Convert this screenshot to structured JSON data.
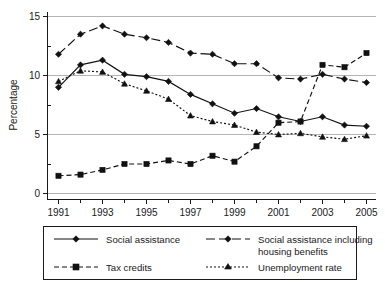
{
  "chart_data": {
    "type": "line",
    "title": "",
    "xlabel": "",
    "ylabel": "Percentage",
    "xlim": [
      1991,
      2005
    ],
    "ylim": [
      0,
      15
    ],
    "yticks": [
      0,
      5,
      10,
      15
    ],
    "ytick_labels": [
      "0",
      "5",
      "10",
      "15"
    ],
    "x": [
      1991,
      1992,
      1993,
      1994,
      1995,
      1996,
      1997,
      1998,
      1999,
      2000,
      2001,
      2002,
      2003,
      2004,
      2005
    ],
    "xtick_labels": [
      "1991",
      "",
      "1993",
      "",
      "1995",
      "",
      "1997",
      "",
      "1999",
      "",
      "2001",
      "",
      "2003",
      "",
      "2005"
    ],
    "grid": true,
    "legend_position": "below",
    "series": [
      {
        "name": "Social assistance",
        "line_style": "solid",
        "marker": "diamond",
        "color": "#111111",
        "values": [
          9.0,
          10.9,
          11.3,
          10.1,
          9.9,
          9.5,
          8.4,
          7.6,
          6.8,
          7.2,
          6.5,
          6.1,
          6.5,
          5.8,
          5.7
        ]
      },
      {
        "name": "Social assistance including housing benefits",
        "line_style": "long-dash",
        "marker": "diamond",
        "color": "#111111",
        "values": [
          11.8,
          13.5,
          14.2,
          13.5,
          13.2,
          12.8,
          11.9,
          11.8,
          11.0,
          11.0,
          9.8,
          9.7,
          10.1,
          9.7,
          9.4
        ]
      },
      {
        "name": "Tax credits",
        "line_style": "dashed",
        "marker": "square",
        "color": "#111111",
        "values": [
          1.5,
          1.6,
          2.0,
          2.5,
          2.5,
          2.8,
          2.5,
          3.2,
          2.7,
          4.0,
          6.0,
          6.1,
          10.9,
          10.7,
          11.9
        ]
      },
      {
        "name": "Unemployment rate",
        "line_style": "dotted",
        "marker": "triangle",
        "color": "#111111",
        "values": [
          9.5,
          10.4,
          10.3,
          9.3,
          8.7,
          8.0,
          6.6,
          6.1,
          5.8,
          5.2,
          5.0,
          5.1,
          4.8,
          4.6,
          4.9
        ]
      }
    ]
  },
  "axis": {
    "ylabel": "Percentage",
    "ytick_0": "0",
    "ytick_5": "5",
    "ytick_10": "10",
    "ytick_15": "15",
    "xtick_1991": "1991",
    "xtick_1993": "1993",
    "xtick_1995": "1995",
    "xtick_1997": "1997",
    "xtick_1999": "1999",
    "xtick_2001": "2001",
    "xtick_2003": "2003",
    "xtick_2005": "2005"
  },
  "legend": {
    "entry_1": "Social assistance",
    "entry_2_line1": "Social assistance including",
    "entry_2_line2": "housing benefits",
    "entry_3": "Tax credits",
    "entry_4": "Unemployment rate"
  }
}
